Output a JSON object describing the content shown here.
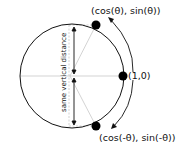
{
  "diagram": {
    "type": "unit-circle",
    "labels": {
      "top_point": "(cos(θ), sin(θ))",
      "right_point": "(1,0)",
      "bottom_point": "(cos(-θ), sin(-θ))",
      "vertical_note": "same vertical distance"
    },
    "colors": {
      "stroke": "#111111",
      "guide": "#bbbbbb",
      "dot": "#000000"
    }
  }
}
